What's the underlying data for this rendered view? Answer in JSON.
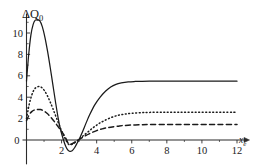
{
  "chart_data": {
    "type": "line",
    "title": "",
    "subtitle": "",
    "ylabel": "ΔQ",
    "ylabel_subscript": "0",
    "xlabel": "x",
    "xlabel_subscript": "e",
    "xlim": [
      0,
      12.4
    ],
    "ylim": [
      -1.9,
      12.0
    ],
    "xticks": [
      0,
      2,
      4,
      6,
      8,
      10,
      12
    ],
    "xtick_labels": [
      "0",
      "2",
      "4",
      "6",
      "8",
      "10",
      "12"
    ],
    "yticks": [
      0,
      2,
      4,
      6,
      8,
      10
    ],
    "ytick_labels": [
      "0",
      "2",
      "4",
      "6",
      "8",
      "10"
    ],
    "yticks_minor": [
      1,
      3,
      5,
      7,
      9,
      11
    ],
    "grid": false,
    "legend_position": "none",
    "annotations": [],
    "series": [
      {
        "name": "solid",
        "style": "solid",
        "color": "#1a1a1a",
        "peak_x": 0.75,
        "peak_y": 11.2,
        "min_x": 2.45,
        "min_y": -1.05,
        "plateau_y": 5.5,
        "x": [
          0.0,
          0.12,
          0.25,
          0.38,
          0.5,
          0.62,
          0.75,
          0.9,
          1.05,
          1.2,
          1.35,
          1.5,
          1.65,
          1.8,
          1.95,
          2.1,
          2.2,
          2.3,
          2.45,
          2.6,
          2.75,
          2.9,
          3.0,
          3.2,
          3.4,
          3.6,
          3.9,
          4.2,
          4.5,
          4.8,
          5.1,
          5.4,
          5.8,
          6.2,
          6.6,
          7.0,
          7.6,
          8.2,
          9.0,
          10.0,
          11.0,
          12.0
        ],
        "y": [
          5.5,
          7.9,
          9.8,
          10.8,
          11.2,
          11.2,
          11.15,
          10.6,
          9.6,
          8.3,
          6.8,
          5.2,
          3.6,
          2.1,
          0.9,
          0.05,
          -0.45,
          -0.8,
          -1.05,
          -1.0,
          -0.7,
          -0.25,
          0.05,
          0.8,
          1.6,
          2.35,
          3.3,
          4.0,
          4.55,
          4.95,
          5.2,
          5.33,
          5.43,
          5.47,
          5.49,
          5.5,
          5.5,
          5.5,
          5.5,
          5.5,
          5.5,
          5.5
        ]
      },
      {
        "name": "dotted",
        "style": "dotted",
        "color": "#1a1a1a",
        "peak_x": 0.75,
        "peak_y": 5.0,
        "min_x": 2.4,
        "min_y": -0.45,
        "plateau_y": 2.6,
        "x": [
          0.0,
          0.15,
          0.3,
          0.45,
          0.6,
          0.75,
          0.9,
          1.05,
          1.2,
          1.35,
          1.5,
          1.7,
          1.9,
          2.05,
          2.2,
          2.4,
          2.6,
          2.8,
          3.0,
          3.2,
          3.5,
          3.8,
          4.1,
          4.4,
          4.8,
          5.2,
          5.6,
          6.0,
          6.5,
          7.0,
          7.8,
          8.6,
          9.5,
          10.5,
          11.5,
          12.0
        ],
        "y": [
          2.0,
          3.3,
          4.2,
          4.75,
          4.95,
          5.0,
          4.85,
          4.55,
          4.1,
          3.55,
          2.95,
          2.1,
          1.25,
          0.65,
          0.15,
          -0.4,
          -0.4,
          -0.2,
          0.05,
          0.35,
          0.75,
          1.15,
          1.5,
          1.78,
          2.08,
          2.3,
          2.42,
          2.5,
          2.55,
          2.58,
          2.6,
          2.6,
          2.6,
          2.6,
          2.6,
          2.6
        ]
      },
      {
        "name": "dashed",
        "style": "dashed",
        "color": "#1a1a1a",
        "peak_x": 0.8,
        "peak_y": 2.85,
        "min_x": 2.4,
        "min_y": -0.35,
        "plateau_y": 1.45,
        "x": [
          0.0,
          0.15,
          0.3,
          0.45,
          0.6,
          0.8,
          1.0,
          1.2,
          1.4,
          1.6,
          1.8,
          2.0,
          2.2,
          2.4,
          2.6,
          2.8,
          3.0,
          3.3,
          3.6,
          4.0,
          4.4,
          4.8,
          5.3,
          5.8,
          6.4,
          7.0,
          8.0,
          9.0,
          10.0,
          11.0,
          12.0
        ],
        "y": [
          1.8,
          2.35,
          2.65,
          2.8,
          2.85,
          2.85,
          2.7,
          2.45,
          2.1,
          1.7,
          1.25,
          0.8,
          0.3,
          -0.35,
          -0.35,
          -0.15,
          0.05,
          0.35,
          0.6,
          0.88,
          1.08,
          1.2,
          1.32,
          1.38,
          1.42,
          1.44,
          1.45,
          1.45,
          1.45,
          1.45,
          1.45
        ]
      }
    ]
  }
}
